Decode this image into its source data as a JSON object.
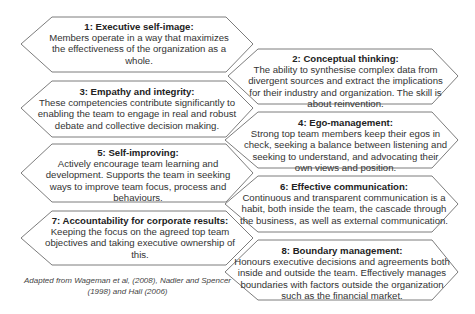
{
  "diagram": {
    "items": [
      {
        "id": 1,
        "title": "1: Executive self-image:",
        "body": "Members operate in a way that maximizes the effectiveness of the organization as a whole."
      },
      {
        "id": 2,
        "title": "2: Conceptual thinking:",
        "body": "The ability to synthesise complex data from divergent sources and extract the implications for their industry and organization. The skill is about reinvention."
      },
      {
        "id": 3,
        "title": "3: Empathy and integrity:",
        "body": "These competencies contribute significantly to enabling the team to engage in real and robust debate and collective decision making."
      },
      {
        "id": 4,
        "title": "4: Ego-management:",
        "body": "Strong top team members keep their egos in check, seeking a balance between listening and seeking to understand, and advocating their own views and position."
      },
      {
        "id": 5,
        "title": "5: Self-improving:",
        "body": "Actively encourage team learning and development. Supports the team in seeking ways to improve team focus, process and behaviours."
      },
      {
        "id": 6,
        "title": "6: Effective communication:",
        "body": "Continuous and transparent communication is a habit, both inside the team, the cascade through the business, as well as external communication."
      },
      {
        "id": 7,
        "title": "7: Accountability for corporate results:",
        "body": "Keeping the focus on the agreed top team objectives and taking executive ownership of this."
      },
      {
        "id": 8,
        "title": "8: Boundary management:",
        "body": "Honours executive decisions and agreements both inside and outside the team. Effectively manages boundaries with factors outside the organization such as the financial market."
      }
    ],
    "caption": "Adapted from Wageman et al, (2008), Nadler and Spencer (1998) and Hall (2006)"
  }
}
